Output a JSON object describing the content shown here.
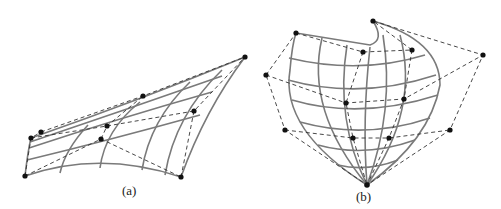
{
  "figure": {
    "panels": [
      {
        "id": "a",
        "caption": "(a)",
        "description": "Surface patch with control net"
      },
      {
        "id": "b",
        "caption": "(b)",
        "description": "Degenerate surface patch converging to single point with control net"
      }
    ]
  }
}
